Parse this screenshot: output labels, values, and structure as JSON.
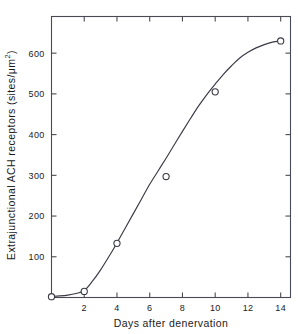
{
  "chart_data": {
    "type": "line",
    "title": "",
    "xlabel": "Days after denervation",
    "ylabel_prefix": "Extrajunctional ACH receptors  (sites/",
    "ylabel_unit": "μm",
    "ylabel_exponent": "2",
    "ylabel_suffix": ")",
    "ylabel_plain": "Extrajunctional ACH receptors (sites/μm2)",
    "xlim": [
      0,
      14.6
    ],
    "ylim": [
      0,
      690
    ],
    "xticks": [
      2,
      4,
      6,
      8,
      10,
      12,
      14
    ],
    "yticks": [
      100,
      200,
      300,
      400,
      500,
      600
    ],
    "xtick_labels": [
      "2",
      "4",
      "6",
      "8",
      "10",
      "12",
      "14"
    ],
    "ytick_labels": [
      "100",
      "200",
      "300",
      "400",
      "500",
      "600"
    ],
    "grid": false,
    "legend": "none",
    "frame": "full-box-inward-ticks",
    "marker": "open-circle",
    "line_color": "#3a3a46",
    "marker_color": "#3a3a46",
    "axis_color": "#4a4a55",
    "points": [
      {
        "x": 0,
        "y": 2
      },
      {
        "x": 2,
        "y": 15
      },
      {
        "x": 4,
        "y": 133
      },
      {
        "x": 7,
        "y": 297
      },
      {
        "x": 10,
        "y": 505
      },
      {
        "x": 14,
        "y": 630
      }
    ],
    "curve": [
      {
        "x": 0.0,
        "y": 3
      },
      {
        "x": 0.5,
        "y": 4
      },
      {
        "x": 1.0,
        "y": 6
      },
      {
        "x": 1.5,
        "y": 10
      },
      {
        "x": 2.0,
        "y": 17
      },
      {
        "x": 2.5,
        "y": 40
      },
      {
        "x": 3.0,
        "y": 68
      },
      {
        "x": 3.5,
        "y": 100
      },
      {
        "x": 4.0,
        "y": 134
      },
      {
        "x": 4.5,
        "y": 170
      },
      {
        "x": 5.0,
        "y": 206
      },
      {
        "x": 5.5,
        "y": 242
      },
      {
        "x": 6.0,
        "y": 278
      },
      {
        "x": 6.5,
        "y": 310
      },
      {
        "x": 7.0,
        "y": 342
      },
      {
        "x": 7.5,
        "y": 375
      },
      {
        "x": 8.0,
        "y": 408
      },
      {
        "x": 8.5,
        "y": 440
      },
      {
        "x": 9.0,
        "y": 471
      },
      {
        "x": 9.5,
        "y": 499
      },
      {
        "x": 10.0,
        "y": 524
      },
      {
        "x": 10.5,
        "y": 548
      },
      {
        "x": 11.0,
        "y": 569
      },
      {
        "x": 11.5,
        "y": 588
      },
      {
        "x": 12.0,
        "y": 602
      },
      {
        "x": 12.5,
        "y": 613
      },
      {
        "x": 13.0,
        "y": 621
      },
      {
        "x": 13.5,
        "y": 627
      },
      {
        "x": 14.0,
        "y": 630
      }
    ]
  }
}
